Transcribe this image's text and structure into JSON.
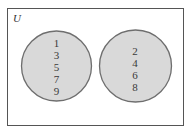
{
  "diagram": {
    "type": "venn",
    "universe_label": "U",
    "colors": {
      "frame": "#555555",
      "circle_fill": "#d9d9d9",
      "circle_stroke": "#6e6e6e",
      "text": "#3a3a3a"
    },
    "sets": [
      {
        "name": "left-set",
        "elements": [
          "1",
          "3",
          "5",
          "7",
          "9"
        ]
      },
      {
        "name": "right-set",
        "elements": [
          "2",
          "4",
          "6",
          "8"
        ]
      }
    ]
  }
}
